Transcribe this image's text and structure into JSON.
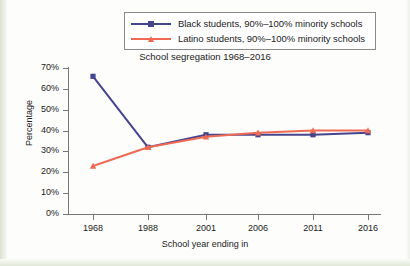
{
  "chart_data": {
    "type": "line",
    "title": "School segregation 1968–2016",
    "xlabel": "School year ending in",
    "ylabel": "Percentage",
    "categories": [
      "1968",
      "1988",
      "2001",
      "2006",
      "2011",
      "2016"
    ],
    "ylim": [
      0,
      70
    ],
    "ytick_labels": [
      "0%",
      "10%",
      "20%",
      "30%",
      "40%",
      "50%",
      "60%",
      "70%"
    ],
    "ytick_values": [
      0,
      10,
      20,
      30,
      40,
      50,
      60,
      70
    ],
    "grid": false,
    "legend_position": "top-center",
    "series": [
      {
        "name": "Black students, 90%–100% minority schools",
        "color": "#45458f",
        "marker": "square",
        "values": [
          66,
          32,
          38,
          38,
          38,
          39
        ]
      },
      {
        "name": "Latino students, 90%–100% minority schools",
        "color": "#ef6a53",
        "marker": "triangle",
        "values": [
          23,
          32,
          37,
          39,
          40,
          40
        ]
      }
    ]
  },
  "legend": {
    "items": [
      {
        "label": "Black students, 90%–100% minority schools",
        "color": "#45458f"
      },
      {
        "label": "Latino students, 90%–100% minority schools",
        "color": "#ef6a53"
      }
    ]
  },
  "colors": {
    "black_students": "#45458f",
    "latino_students": "#ef6a53",
    "axis": "#777777",
    "text": "#1b1b1b"
  }
}
